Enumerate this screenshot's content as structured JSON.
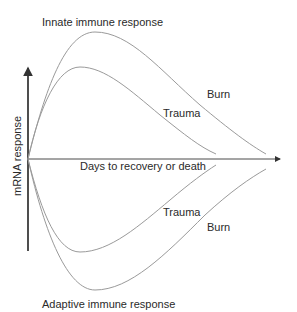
{
  "diagram": {
    "title_top": "Innate immune response",
    "title_bottom": "Adaptive immune response",
    "y_axis_label": "mRNA response",
    "x_axis_label": "Days to recovery or death",
    "curves": {
      "innate_burn_label": "Burn",
      "innate_trauma_label": "Trauma",
      "adaptive_trauma_label": "Trauma",
      "adaptive_burn_label": "Burn"
    },
    "colors": {
      "curve": "#9a9a9a",
      "axis": "#4a4a4a",
      "text": "#2a2a2a"
    }
  }
}
